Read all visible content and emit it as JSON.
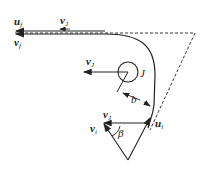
{
  "diagram": {
    "type": "physics-vector-diagram",
    "labels": {
      "u_f": {
        "base": "u",
        "sub": "f"
      },
      "v_J_top": {
        "base": "v",
        "sub": "J"
      },
      "v_f": {
        "base": "v",
        "sub": "f"
      },
      "v_J_mid": {
        "base": "v",
        "sub": "J"
      },
      "J": "J",
      "b": "b",
      "v_J_tri": {
        "base": "v",
        "sub": "J"
      },
      "v_i": {
        "base": "v",
        "sub": "i"
      },
      "beta": "β",
      "u_i": {
        "base": "u",
        "sub": "i"
      }
    },
    "colors": {
      "line": "#222222",
      "background": "#ffffff"
    }
  }
}
